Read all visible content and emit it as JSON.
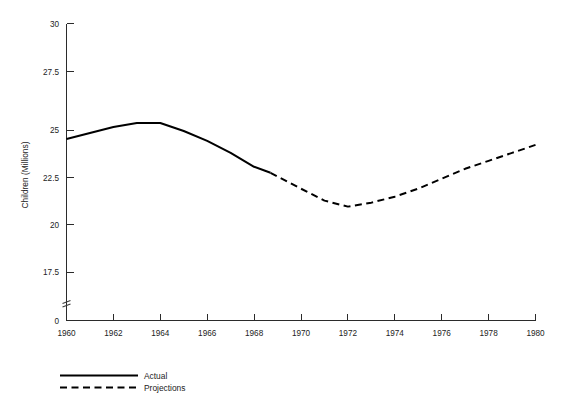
{
  "chart_data": {
    "type": "line",
    "title": "",
    "xlabel": "",
    "ylabel": "Children (Millions)",
    "xlim": [
      1960,
      1980
    ],
    "ylim": [
      17.5,
      30
    ],
    "y_axis_break": true,
    "y_break_label": "0",
    "grid": false,
    "legend_position": "below-left",
    "xticks": [
      1960,
      1962,
      1964,
      1966,
      1968,
      1970,
      1972,
      1974,
      1976,
      1978,
      1980
    ],
    "xtick_labels": [
      "1960",
      "1962",
      "1964",
      "1966",
      "1968",
      "1970",
      "1972",
      "1974",
      "1976",
      "1978",
      "1980"
    ],
    "yticks": [
      17.5,
      20,
      22.5,
      25,
      27.5,
      30
    ],
    "ytick_labels": [
      "17.5",
      "20",
      "22.5",
      "25",
      "27.5",
      "30"
    ],
    "series": [
      {
        "name": "Actual",
        "style": "solid",
        "x": [
          1960,
          1961,
          1962,
          1963,
          1964,
          1965,
          1966,
          1967,
          1968,
          1968.7
        ],
        "values": [
          24.2,
          24.5,
          24.8,
          25.0,
          25.0,
          24.6,
          24.1,
          23.5,
          22.8,
          22.5
        ]
      },
      {
        "name": "Projections",
        "style": "dashed",
        "x": [
          1968.7,
          1970,
          1971,
          1972,
          1973,
          1974,
          1975,
          1976,
          1977,
          1978,
          1979,
          1980
        ],
        "values": [
          22.5,
          21.7,
          21.1,
          20.8,
          21.0,
          21.3,
          21.7,
          22.2,
          22.7,
          23.1,
          23.5,
          23.9
        ]
      }
    ]
  },
  "legend": {
    "entries": [
      {
        "label": "Actual",
        "style": "solid"
      },
      {
        "label": "Projections",
        "style": "dashed"
      }
    ]
  }
}
